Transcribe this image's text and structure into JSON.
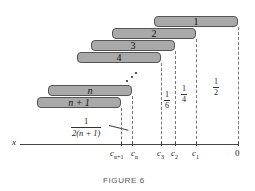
{
  "figure": {
    "caption": "FIGURE 6",
    "axis_label": "x",
    "bars": [
      {
        "label": "1",
        "left": 154,
        "top": 16,
        "width": 84
      },
      {
        "label": "2",
        "left": 112,
        "top": 28,
        "width": 84
      },
      {
        "label": "3",
        "left": 91,
        "top": 40,
        "width": 84
      },
      {
        "label": "4",
        "left": 77,
        "top": 52,
        "width": 84
      },
      {
        "label": "n",
        "left": 48,
        "top": 85,
        "width": 84
      },
      {
        "label": "n + 1",
        "left": 37,
        "top": 97,
        "width": 84
      }
    ],
    "ticks": [
      {
        "name": "c_{n+1}",
        "base": "c",
        "sub": "n+1",
        "x": 121
      },
      {
        "name": "c_n",
        "base": "c",
        "sub": "n",
        "x": 132
      },
      {
        "name": "c_3",
        "base": "c",
        "sub": "3",
        "x": 161
      },
      {
        "name": "c_2",
        "base": "c",
        "sub": "2",
        "x": 175
      },
      {
        "name": "c_1",
        "base": "c",
        "sub": "1",
        "x": 196
      },
      {
        "name": "0",
        "base": "0",
        "sub": "",
        "x": 238
      }
    ],
    "fractions": {
      "f16": {
        "num": "1",
        "den": "6"
      },
      "f14": {
        "num": "1",
        "den": "4"
      },
      "f12": {
        "num": "1",
        "den": "2"
      },
      "f2n1": {
        "num": "1",
        "den": "2(n + 1)"
      }
    }
  }
}
